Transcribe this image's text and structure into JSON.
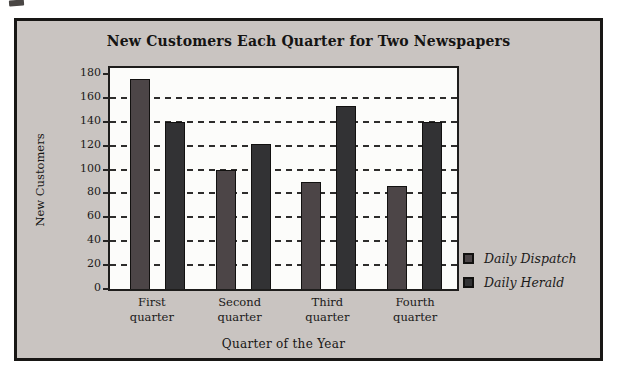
{
  "figure": {
    "page_background": "#ffffff",
    "panel_background": "#c9c4c1",
    "panel_border_color": "#181715",
    "plot_background": "#fcfcfa"
  },
  "chart_data": {
    "type": "bar",
    "title": "New Customers Each Quarter for Two Newspapers",
    "xlabel": "Quarter of the Year",
    "ylabel": "New Customers",
    "categories": [
      "First quarter",
      "Second quarter",
      "Third quarter",
      "Fourth quarter"
    ],
    "series": [
      {
        "name": "Daily Dispatch",
        "color": "#4c4547",
        "values": [
          176,
          100,
          90,
          86
        ]
      },
      {
        "name": "Daily Herald",
        "color": "#323234",
        "values": [
          140,
          121,
          153,
          140
        ]
      }
    ],
    "ylim": [
      0,
      180
    ],
    "yticks": [
      0,
      20,
      40,
      60,
      80,
      100,
      120,
      140,
      160,
      180
    ],
    "gridlines": [
      20,
      40,
      60,
      80,
      100,
      120,
      140,
      160
    ],
    "grid_style": "dashed",
    "legend_position": "right-bottom",
    "legend_entries": [
      "Daily Dispatch",
      "Daily Herald"
    ]
  }
}
